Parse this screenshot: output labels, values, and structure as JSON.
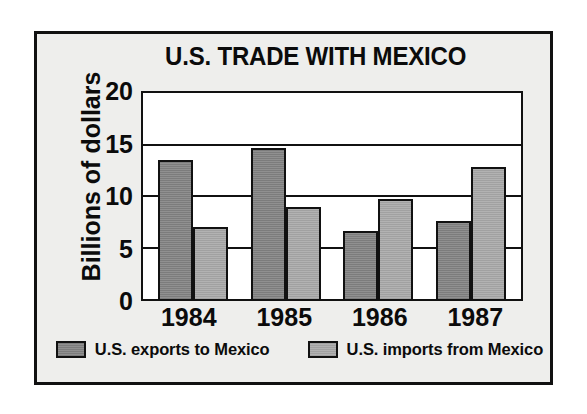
{
  "figure": {
    "background_color": "#eeeeec",
    "border_color": "#111111",
    "plot_background_color": "#ffffff"
  },
  "chart_data": {
    "type": "bar",
    "title": "U.S. TRADE WITH MEXICO",
    "xlabel": "",
    "ylabel": "Billions of dollars",
    "categories": [
      "1984",
      "1985",
      "1986",
      "1987"
    ],
    "series": [
      {
        "name": "U.S. exports to Mexico",
        "color": "#8a8a8a",
        "values": [
          13.2,
          14.4,
          6.5,
          7.4
        ]
      },
      {
        "name": "U.S. imports from Mexico",
        "color": "#adadad",
        "values": [
          6.9,
          8.8,
          9.5,
          12.6
        ]
      }
    ],
    "ylim": [
      0,
      20
    ],
    "yticks": [
      0,
      5,
      10,
      15,
      20
    ],
    "ytick_labels": [
      "0",
      "5",
      "10",
      "15",
      "20"
    ],
    "grid": true,
    "grid_orientation": "horizontal",
    "legend_position": "bottom"
  },
  "legend": {
    "items": [
      {
        "label": "U.S. exports to Mexico",
        "swatch": "exports"
      },
      {
        "label": "U.S. imports from Mexico",
        "swatch": "imports"
      }
    ]
  }
}
